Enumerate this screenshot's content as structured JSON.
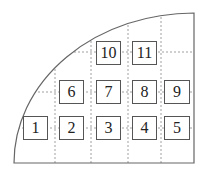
{
  "diagram": {
    "frame": {
      "left": 14,
      "right": 194,
      "top": 13,
      "bottom": 163,
      "stroke": "#666666"
    },
    "grid": {
      "vertical_x": [
        55,
        91,
        128,
        161
      ],
      "horizontal_y": [
        52,
        92,
        128
      ],
      "stroke": "#888888",
      "dash": "2,2"
    },
    "cells": [
      {
        "label": "1",
        "x": 23,
        "y": 116,
        "w": 25,
        "h": 24
      },
      {
        "label": "2",
        "x": 59,
        "y": 116,
        "w": 25,
        "h": 24
      },
      {
        "label": "3",
        "x": 96,
        "y": 116,
        "w": 25,
        "h": 24
      },
      {
        "label": "4",
        "x": 132,
        "y": 116,
        "w": 25,
        "h": 24
      },
      {
        "label": "5",
        "x": 164,
        "y": 116,
        "w": 26,
        "h": 24
      },
      {
        "label": "6",
        "x": 59,
        "y": 80,
        "w": 25,
        "h": 24
      },
      {
        "label": "7",
        "x": 96,
        "y": 80,
        "w": 25,
        "h": 24
      },
      {
        "label": "8",
        "x": 132,
        "y": 80,
        "w": 25,
        "h": 24
      },
      {
        "label": "9",
        "x": 164,
        "y": 80,
        "w": 26,
        "h": 24
      },
      {
        "label": "10",
        "x": 96,
        "y": 41,
        "w": 25,
        "h": 24
      },
      {
        "label": "11",
        "x": 132,
        "y": 41,
        "w": 25,
        "h": 24
      }
    ]
  }
}
